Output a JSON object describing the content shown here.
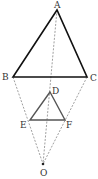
{
  "diagram": {
    "type": "homothety-triangles",
    "labels": {
      "A": "A",
      "B": "B",
      "C": "C",
      "D": "D",
      "E": "E",
      "F": "F",
      "O": "O"
    },
    "points": {
      "A": [
        57,
        10
      ],
      "B": [
        13,
        77
      ],
      "C": [
        87,
        77
      ],
      "D": [
        50,
        92
      ],
      "E": [
        30,
        120
      ],
      "F": [
        65,
        120
      ],
      "O": [
        43,
        164
      ]
    },
    "large_triangle": [
      "A",
      "B",
      "C"
    ],
    "small_triangle": [
      "D",
      "E",
      "F"
    ],
    "dashed_lines": [
      [
        "A",
        "O"
      ],
      [
        "B",
        "O"
      ],
      [
        "C",
        "O"
      ]
    ],
    "colors": {
      "triangle_stroke": "#111111",
      "small_triangle_stroke": "#555555",
      "dashed": "#777777",
      "label": "#333333"
    }
  }
}
